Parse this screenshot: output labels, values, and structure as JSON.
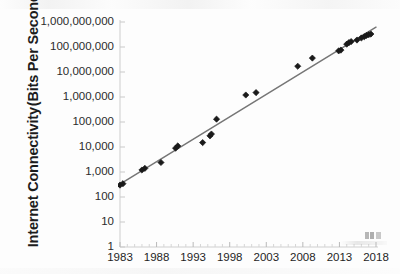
{
  "chart_data": {
    "type": "scatter",
    "title": "",
    "subtitle": "",
    "xlabel": "",
    "ylabel": "Internet Connectivity (Bits Per Second)",
    "ylabel_lines": [
      "Internet Connectivity",
      "(Bits Per Second)"
    ],
    "yscale": "log",
    "xlim": [
      1983,
      2018
    ],
    "ylim": [
      1,
      1000000000
    ],
    "grid": false,
    "legend": null,
    "x_tick_labels": [
      "1983",
      "1988",
      "1993",
      "1998",
      "2003",
      "2008",
      "2013",
      "2018"
    ],
    "x_tick_values": [
      1983,
      1988,
      1993,
      1998,
      2003,
      2008,
      2013,
      2018
    ],
    "x_minor_tick_interval": 1,
    "y_tick_labels": [
      "1,000,000,000",
      "100,000,000",
      "10,000,000",
      "1,000,000",
      "100,000",
      "10,000",
      "1,000",
      "100",
      "10",
      "1"
    ],
    "y_tick_values": [
      1000000000,
      100000000,
      10000000,
      1000000,
      100000,
      10000,
      1000,
      100,
      10,
      1
    ],
    "series": [
      {
        "name": "Internet Connectivity",
        "marker": "diamond",
        "color": "#1a1a1a",
        "points": [
          {
            "x": 1983,
            "y": 300
          },
          {
            "x": 1983.4,
            "y": 340
          },
          {
            "x": 1986,
            "y": 1200
          },
          {
            "x": 1986.4,
            "y": 1400
          },
          {
            "x": 1988.6,
            "y": 2400
          },
          {
            "x": 1990.6,
            "y": 9000
          },
          {
            "x": 1990.9,
            "y": 11000
          },
          {
            "x": 1994.3,
            "y": 15000
          },
          {
            "x": 1995.3,
            "y": 28000
          },
          {
            "x": 1995.5,
            "y": 33000
          },
          {
            "x": 1996.2,
            "y": 130000
          },
          {
            "x": 2000.2,
            "y": 1200000
          },
          {
            "x": 2001.6,
            "y": 1500000
          },
          {
            "x": 2007.3,
            "y": 17000000
          },
          {
            "x": 2009.3,
            "y": 36000000
          },
          {
            "x": 2012.9,
            "y": 70000000
          },
          {
            "x": 2013.2,
            "y": 75000000
          },
          {
            "x": 2014.0,
            "y": 130000000
          },
          {
            "x": 2014.3,
            "y": 150000000
          },
          {
            "x": 2014.6,
            "y": 165000000
          },
          {
            "x": 2015.4,
            "y": 190000000
          },
          {
            "x": 2016.0,
            "y": 230000000
          },
          {
            "x": 2016.4,
            "y": 260000000
          },
          {
            "x": 2016.7,
            "y": 290000000
          },
          {
            "x": 2017.0,
            "y": 310000000
          },
          {
            "x": 2017.3,
            "y": 330000000
          }
        ]
      }
    ],
    "trendline": {
      "name": "trend",
      "color": "#767676",
      "start": {
        "x": 1983,
        "y": 330
      },
      "end": {
        "x": 2018,
        "y": 620000000
      }
    },
    "annotations": []
  }
}
